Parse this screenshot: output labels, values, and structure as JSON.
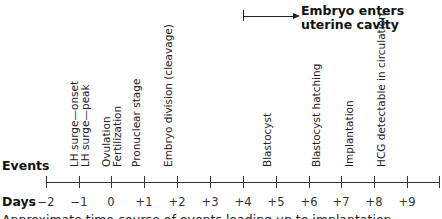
{
  "callout": {
    "line1": "Embryo enters",
    "line2": "uterine cavity",
    "arrow_from_day": "+4"
  },
  "row_labels": {
    "events": "Events",
    "days": "Days"
  },
  "days": [
    "−2",
    "−1",
    "0",
    "+1",
    "+2",
    "+3",
    "+4",
    "+5",
    "+6",
    "+7",
    "+8",
    "+9"
  ],
  "events": [
    {
      "day": "−1",
      "label": "LH surge—onset"
    },
    {
      "day": "−1",
      "label": "LH surge—peak"
    },
    {
      "day": "0",
      "label": "Ovulation"
    },
    {
      "day": "0",
      "label": "Fertilization"
    },
    {
      "day": "+1",
      "label": "Pronuclear stage"
    },
    {
      "day": "+2",
      "label": "Embryo division (cleavage)"
    },
    {
      "day": "+5",
      "label": "Blastocyst"
    },
    {
      "day": "+6.5",
      "label": "Blastocyst hatching"
    },
    {
      "day": "+7.5",
      "label": "Implantation"
    },
    {
      "day": "+8.5",
      "label": "HCG detectable in circulation"
    }
  ],
  "caption": "Approximate time course of events leading up to implantation"
}
